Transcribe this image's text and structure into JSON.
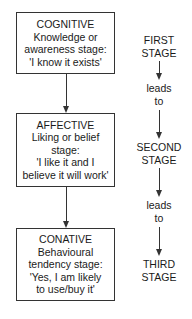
{
  "diagram": {
    "stages": [
      {
        "title": "COGNITIVE",
        "lines": [
          "Knowledge or",
          "awareness stage:",
          "'I know it exists'"
        ]
      },
      {
        "title": "AFFECTIVE",
        "lines": [
          "Liking or belief",
          "stage:",
          "'I like it and I",
          "believe it will work'"
        ]
      },
      {
        "title": "CONATIVE",
        "lines": [
          "Behavioural",
          "tendency stage:",
          "'Yes, I am likely",
          "to use/buy it'"
        ]
      }
    ],
    "stage_labels": [
      {
        "line1": "FIRST",
        "line2": "STAGE"
      },
      {
        "line1": "SECOND",
        "line2": "STAGE"
      },
      {
        "line1": "THIRD",
        "line2": "STAGE"
      }
    ],
    "connector_labels": [
      {
        "line1": "leads",
        "line2": "to"
      },
      {
        "line1": "leads",
        "line2": "to"
      }
    ]
  }
}
